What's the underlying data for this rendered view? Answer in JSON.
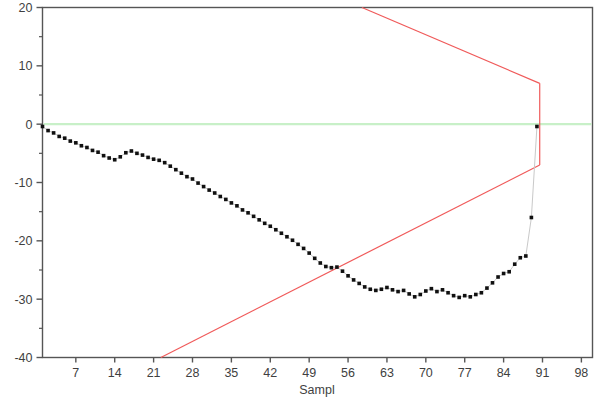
{
  "chart_data": {
    "type": "scatter",
    "title": "",
    "subtitle": "",
    "xlabel": "Sampl",
    "ylabel": "",
    "xlim": [
      1,
      100
    ],
    "ylim": [
      -40,
      20
    ],
    "grid": false,
    "legend": null,
    "x_ticks": [
      7,
      14,
      21,
      28,
      35,
      42,
      49,
      56,
      63,
      70,
      77,
      84,
      91,
      98
    ],
    "y_ticks": [
      20,
      10,
      0,
      -10,
      -20,
      -30,
      -40
    ],
    "y_minor_ticks": [
      15,
      5,
      -5,
      -15,
      -25,
      -35
    ],
    "marker": "filled-square",
    "marker_color": "#101010",
    "connector_color": "#c9c9c9",
    "series": [
      {
        "name": "Cumulative sum",
        "color": "#101010",
        "x": [
          1,
          2,
          3,
          4,
          5,
          6,
          7,
          8,
          9,
          10,
          11,
          12,
          13,
          14,
          15,
          16,
          17,
          18,
          19,
          20,
          21,
          22,
          23,
          24,
          25,
          26,
          27,
          28,
          29,
          30,
          31,
          32,
          33,
          34,
          35,
          36,
          37,
          38,
          39,
          40,
          41,
          42,
          43,
          44,
          45,
          46,
          47,
          48,
          49,
          50,
          51,
          52,
          53,
          54,
          55,
          56,
          57,
          58,
          59,
          60,
          61,
          62,
          63,
          64,
          65,
          66,
          67,
          68,
          69,
          70,
          71,
          72,
          73,
          74,
          75,
          76,
          77,
          78,
          79,
          80,
          81,
          82,
          83,
          84,
          85,
          86,
          87,
          88,
          89,
          90
        ],
        "values": [
          -0.4,
          -1.1,
          -1.5,
          -2.1,
          -2.4,
          -2.9,
          -3.2,
          -3.7,
          -4.0,
          -4.5,
          -4.8,
          -5.4,
          -5.8,
          -6.1,
          -5.6,
          -4.9,
          -4.6,
          -5.0,
          -5.3,
          -5.7,
          -6.0,
          -6.2,
          -6.6,
          -7.2,
          -7.8,
          -8.4,
          -9.0,
          -9.4,
          -10.1,
          -10.7,
          -11.3,
          -11.8,
          -12.4,
          -12.9,
          -13.5,
          -14.0,
          -14.7,
          -15.2,
          -15.8,
          -16.4,
          -17.0,
          -17.5,
          -18.1,
          -18.7,
          -19.3,
          -19.9,
          -20.6,
          -21.3,
          -22.1,
          -23.0,
          -23.8,
          -24.4,
          -24.6,
          -24.5,
          -25.2,
          -26.0,
          -26.7,
          -27.3,
          -27.9,
          -28.3,
          -28.5,
          -28.3,
          -28.0,
          -28.4,
          -28.7,
          -28.5,
          -29.1,
          -29.6,
          -29.2,
          -28.6,
          -28.2,
          -28.7,
          -28.4,
          -28.9,
          -29.4,
          -29.7,
          -29.4,
          -29.6,
          -29.2,
          -28.9,
          -28.1,
          -27.2,
          -26.2,
          -25.6,
          -25.3,
          -24.0,
          -22.9,
          -22.6,
          -16.0,
          -0.4
        ]
      }
    ],
    "reference_lines": [
      {
        "name": "center-line",
        "color": "#c8f0c8",
        "orientation": "horizontal",
        "value": 0
      }
    ],
    "control_limits": {
      "name": "v-mask",
      "color": "#f05a5a",
      "vertex_x": 90.5,
      "upper_arm_y_at_vertex": 7.0,
      "lower_arm_y_at_vertex": -7.0,
      "upper_arm_exit": {
        "x": 58.5,
        "y": 20
      },
      "lower_arm_exit": {
        "x": 22.3,
        "y": -40
      }
    }
  }
}
